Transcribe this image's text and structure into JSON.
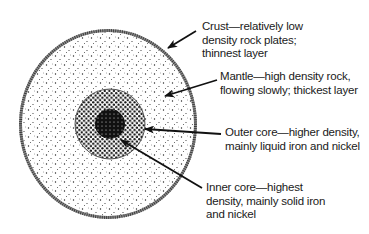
{
  "diagram": {
    "layers": [
      {
        "id": "crust",
        "name": "Crust",
        "lines": [
          "Crust—relatively low",
          "density rock plates;",
          "thinnest layer"
        ]
      },
      {
        "id": "mantle",
        "name": "Mantle",
        "lines": [
          "Mantle—high density rock,",
          "flowing slowly; thickest layer"
        ]
      },
      {
        "id": "outer-core",
        "name": "Outer core",
        "lines": [
          "Outer core—higher density,",
          "mainly liquid iron and nickel"
        ]
      },
      {
        "id": "inner-core",
        "name": "Inner core",
        "lines": [
          "Inner core—highest",
          "density, mainly solid iron",
          "and nickel"
        ]
      }
    ],
    "colors": {
      "ink": "#1a1a1a",
      "background": "#ffffff",
      "crust": "#8a8a8a"
    }
  }
}
